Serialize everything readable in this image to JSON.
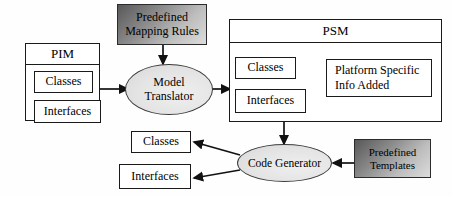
{
  "diagram": {
    "colors": {
      "stroke": "#1a1a1a",
      "ellipse_fill": "#e2e2e2",
      "gradient_dark": "#585858",
      "gradient_light": "#dcdcdc",
      "background": "#ffffff"
    },
    "nodes": {
      "pim": {
        "label": "PIM",
        "children": [
          {
            "label": "Classes"
          },
          {
            "label": "Interfaces"
          }
        ]
      },
      "predefined_mapping_rules": {
        "line1": "Predefined",
        "line2": "Mapping Rules"
      },
      "model_translator": {
        "line1": "Model",
        "line2": "Translator"
      },
      "psm": {
        "label": "PSM",
        "children": [
          {
            "label": "Classes"
          },
          {
            "label": "Interfaces"
          }
        ],
        "note": {
          "line1": "Platform   Specific",
          "line2": "Info Added"
        }
      },
      "code_generator": {
        "label": "Code Generator"
      },
      "predefined_templates": {
        "line1": "Predefined",
        "line2": "Templates"
      },
      "output": {
        "classes": {
          "label": "Classes"
        },
        "interfaces": {
          "label": "Interfaces"
        }
      }
    },
    "edges": [
      {
        "name": "pim-to-model-translator",
        "from": "PIM",
        "to": "Model Translator"
      },
      {
        "name": "mapping-rules-to-model-translator",
        "from": "Predefined Mapping Rules",
        "to": "Model Translator"
      },
      {
        "name": "model-translator-to-psm",
        "from": "Model Translator",
        "to": "PSM"
      },
      {
        "name": "platform-info-to-classes",
        "from": "Platform Specific Info Added",
        "to": "Classes"
      },
      {
        "name": "platform-info-to-interfaces",
        "from": "Platform Specific Info Added",
        "to": "Interfaces"
      },
      {
        "name": "psm-to-code-generator",
        "from": "PSM",
        "to": "Code Generator"
      },
      {
        "name": "templates-to-code-generator",
        "from": "Predefined Templates",
        "to": "Code Generator"
      },
      {
        "name": "code-generator-to-classes",
        "from": "Code Generator",
        "to": "Classes"
      },
      {
        "name": "code-generator-to-interfaces",
        "from": "Code Generator",
        "to": "Interfaces"
      }
    ]
  }
}
